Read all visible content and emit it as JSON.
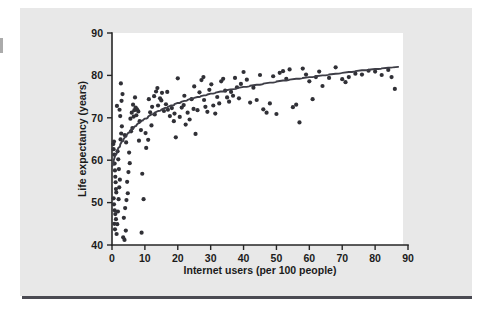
{
  "figure": {
    "kind": "scatterplot-figure",
    "background_color": "#e8e8e8",
    "plot_background_color": "#ffffff",
    "rule_color": "#4a4a52"
  },
  "chart_data": {
    "type": "scatter",
    "title": "",
    "subtitle": "",
    "xlabel": "Internet users (per 100 people)",
    "ylabel": "Life expectancy (years)",
    "xlim": [
      0,
      90
    ],
    "ylim": [
      40,
      90
    ],
    "xticks": [
      0,
      10,
      20,
      30,
      40,
      50,
      60,
      70,
      80,
      90
    ],
    "yticks": [
      40,
      50,
      60,
      70,
      80,
      90
    ],
    "xtick_labels": [
      "0",
      "10",
      "20",
      "30",
      "40",
      "50",
      "60",
      "70",
      "80",
      "90"
    ],
    "ytick_labels": [
      "40",
      "50",
      "60",
      "70",
      "80",
      "90"
    ],
    "grid": false,
    "legend": null,
    "legend_position": "none",
    "marker_color": "#303036",
    "marker_size": 2.1,
    "annotations": [],
    "series": [
      {
        "name": "Countries",
        "type": "scatter",
        "points": [
          [
            0.4,
            63.8
          ],
          [
            0.5,
            62.6
          ],
          [
            0.6,
            64.4
          ],
          [
            0.7,
            61.3
          ],
          [
            0.8,
            59.2
          ],
          [
            0.9,
            57.6
          ],
          [
            1.0,
            56.1
          ],
          [
            1.1,
            54.8
          ],
          [
            1.2,
            53.2
          ],
          [
            1.3,
            52.4
          ],
          [
            0.5,
            51.0
          ],
          [
            0.6,
            49.6
          ],
          [
            0.8,
            48.2
          ],
          [
            1.0,
            47.3
          ],
          [
            1.2,
            46.1
          ],
          [
            0.7,
            45.0
          ],
          [
            0.9,
            43.7
          ],
          [
            1.4,
            42.6
          ],
          [
            1.6,
            44.9
          ],
          [
            1.8,
            47.9
          ],
          [
            2.0,
            50.8
          ],
          [
            2.2,
            53.6
          ],
          [
            2.4,
            55.4
          ],
          [
            2.1,
            57.9
          ],
          [
            1.9,
            60.2
          ],
          [
            1.7,
            62.1
          ],
          [
            2.6,
            64.9
          ],
          [
            2.8,
            66.3
          ],
          [
            3.0,
            68.0
          ],
          [
            2.5,
            70.4
          ],
          [
            2.3,
            71.9
          ],
          [
            1.5,
            72.8
          ],
          [
            2.9,
            74.0
          ],
          [
            3.2,
            75.6
          ],
          [
            2.7,
            78.1
          ],
          [
            3.4,
            41.8
          ],
          [
            3.8,
            41.2
          ],
          [
            4.2,
            43.4
          ],
          [
            3.6,
            46.4
          ],
          [
            4.0,
            48.7
          ],
          [
            4.4,
            50.6
          ],
          [
            4.8,
            52.2
          ],
          [
            4.6,
            54.9
          ],
          [
            5.0,
            57.2
          ],
          [
            5.4,
            59.3
          ],
          [
            5.2,
            61.8
          ],
          [
            4.3,
            64.2
          ],
          [
            3.9,
            65.9
          ],
          [
            5.8,
            66.8
          ],
          [
            6.2,
            67.6
          ],
          [
            5.6,
            69.8
          ],
          [
            6.6,
            70.3
          ],
          [
            6.0,
            71.2
          ],
          [
            6.8,
            71.8
          ],
          [
            7.2,
            72.4
          ],
          [
            6.4,
            73.1
          ],
          [
            7.6,
            72.0
          ],
          [
            7.0,
            74.8
          ],
          [
            8.0,
            71.5
          ],
          [
            7.4,
            70.6
          ],
          [
            8.4,
            69.2
          ],
          [
            8.8,
            67.1
          ],
          [
            8.2,
            64.6
          ],
          [
            9.2,
            56.8
          ],
          [
            9.6,
            50.8
          ],
          [
            9.0,
            42.9
          ],
          [
            10.4,
            62.9
          ],
          [
            11.0,
            64.8
          ],
          [
            10.2,
            66.4
          ],
          [
            11.6,
            71.3
          ],
          [
            12.2,
            72.6
          ],
          [
            11.2,
            74.4
          ],
          [
            12.8,
            75.1
          ],
          [
            13.4,
            76.2
          ],
          [
            12.0,
            68.2
          ],
          [
            13.0,
            70.8
          ],
          [
            14.0,
            72.9
          ],
          [
            14.6,
            74.6
          ],
          [
            15.2,
            75.9
          ],
          [
            13.8,
            77.0
          ],
          [
            15.8,
            71.6
          ],
          [
            16.4,
            73.2
          ],
          [
            15.0,
            74.1
          ],
          [
            17.0,
            71.9
          ],
          [
            17.6,
            70.4
          ],
          [
            16.8,
            76.1
          ],
          [
            18.2,
            72.3
          ],
          [
            18.8,
            69.2
          ],
          [
            19.4,
            65.4
          ],
          [
            20.0,
            79.3
          ],
          [
            19.0,
            71.0
          ],
          [
            20.6,
            70.2
          ],
          [
            21.2,
            72.4
          ],
          [
            21.8,
            73.0
          ],
          [
            22.4,
            68.4
          ],
          [
            23.0,
            71.2
          ],
          [
            23.6,
            69.6
          ],
          [
            22.0,
            75.2
          ],
          [
            24.2,
            74.4
          ],
          [
            24.8,
            72.1
          ],
          [
            25.4,
            66.2
          ],
          [
            26.0,
            71.8
          ],
          [
            26.6,
            76.0
          ],
          [
            27.2,
            78.9
          ],
          [
            27.8,
            79.6
          ],
          [
            25.0,
            77.4
          ],
          [
            28.4,
            72.6
          ],
          [
            29.0,
            71.4
          ],
          [
            28.0,
            74.2
          ],
          [
            29.6,
            76.6
          ],
          [
            30.2,
            77.9
          ],
          [
            30.8,
            72.9
          ],
          [
            31.4,
            71.0
          ],
          [
            32.0,
            74.9
          ],
          [
            32.6,
            73.4
          ],
          [
            33.2,
            78.6
          ],
          [
            33.8,
            79.2
          ],
          [
            34.4,
            76.4
          ],
          [
            35.0,
            74.8
          ],
          [
            35.6,
            73.8
          ],
          [
            36.2,
            76.1
          ],
          [
            36.8,
            75.2
          ],
          [
            37.4,
            79.4
          ],
          [
            38.0,
            77.2
          ],
          [
            38.6,
            74.6
          ],
          [
            39.2,
            78.0
          ],
          [
            40.0,
            80.8
          ],
          [
            41.0,
            79.0
          ],
          [
            42.0,
            73.6
          ],
          [
            43.0,
            77.1
          ],
          [
            44.0,
            74.2
          ],
          [
            45.0,
            80.1
          ],
          [
            46.0,
            72.0
          ],
          [
            47.0,
            71.2
          ],
          [
            48.0,
            73.4
          ],
          [
            49.0,
            79.8
          ],
          [
            50.0,
            70.9
          ],
          [
            51.0,
            80.6
          ],
          [
            52.0,
            81.0
          ],
          [
            53.0,
            79.2
          ],
          [
            54.0,
            81.4
          ],
          [
            55.0,
            72.5
          ],
          [
            56.0,
            73.1
          ],
          [
            57.0,
            68.9
          ],
          [
            58.0,
            81.6
          ],
          [
            59.0,
            80.2
          ],
          [
            60.0,
            78.6
          ],
          [
            61.0,
            74.4
          ],
          [
            62.0,
            79.6
          ],
          [
            63.0,
            80.9
          ],
          [
            64.0,
            77.5
          ],
          [
            66.0,
            79.4
          ],
          [
            68.0,
            81.9
          ],
          [
            70.0,
            79.1
          ],
          [
            71.0,
            78.4
          ],
          [
            72.0,
            79.6
          ],
          [
            74.0,
            80.4
          ],
          [
            76.0,
            80.2
          ],
          [
            78.0,
            81.1
          ],
          [
            80.0,
            80.9
          ],
          [
            82.0,
            80.1
          ],
          [
            85.0,
            79.6
          ],
          [
            86.0,
            76.8
          ],
          [
            84.0,
            81.3
          ]
        ]
      }
    ],
    "trend": {
      "name": "Logarithmic trend line",
      "type": "line",
      "color": "#3d3d46",
      "points": [
        [
          0.0,
          58.6
        ],
        [
          1.0,
          61.2
        ],
        [
          2.0,
          63.0
        ],
        [
          3.0,
          64.4
        ],
        [
          4.0,
          65.5
        ],
        [
          5.0,
          66.5
        ],
        [
          6.0,
          67.3
        ],
        [
          7.0,
          68.0
        ],
        [
          8.0,
          68.7
        ],
        [
          9.0,
          69.3
        ],
        [
          10.0,
          69.8
        ],
        [
          12.0,
          70.8
        ],
        [
          14.0,
          71.6
        ],
        [
          16.0,
          72.3
        ],
        [
          18.0,
          72.9
        ],
        [
          20.0,
          73.5
        ],
        [
          22.0,
          74.0
        ],
        [
          24.0,
          74.5
        ],
        [
          26.0,
          74.9
        ],
        [
          28.0,
          75.3
        ],
        [
          30.0,
          75.7
        ],
        [
          33.0,
          76.2
        ],
        [
          36.0,
          76.7
        ],
        [
          40.0,
          77.3
        ],
        [
          44.0,
          77.8
        ],
        [
          48.0,
          78.3
        ],
        [
          52.0,
          78.8
        ],
        [
          56.0,
          79.2
        ],
        [
          60.0,
          79.6
        ],
        [
          64.0,
          80.0
        ],
        [
          68.0,
          80.4
        ],
        [
          72.0,
          80.8
        ],
        [
          76.0,
          81.2
        ],
        [
          80.0,
          81.5
        ],
        [
          84.0,
          81.8
        ],
        [
          87.0,
          82.0
        ]
      ]
    }
  }
}
